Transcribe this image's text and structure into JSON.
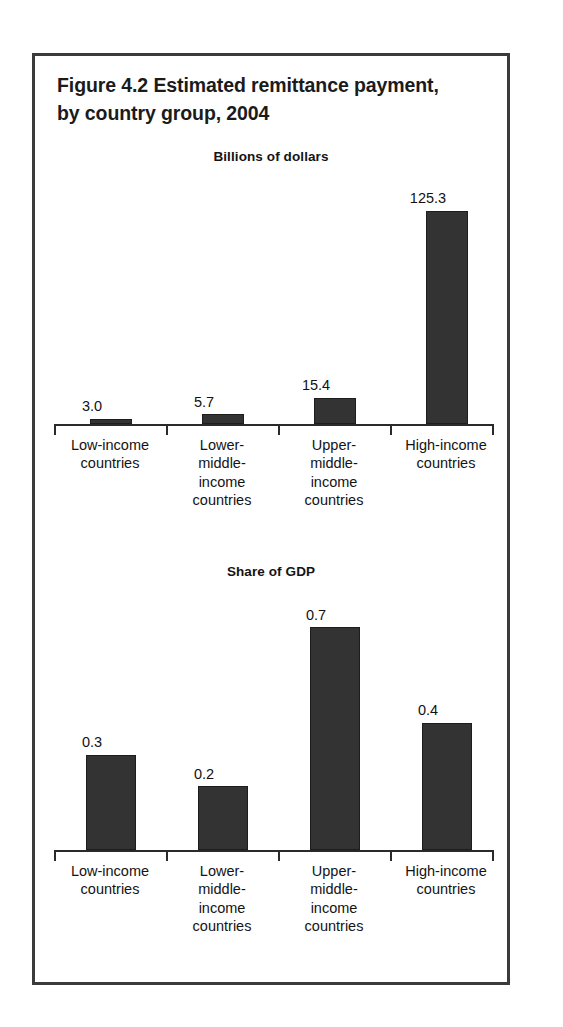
{
  "figure": {
    "title": "Figure 4.2  Estimated remittance payment,\nby country group, 2004"
  },
  "chart_data": [
    {
      "type": "bar",
      "title": "Billions of dollars",
      "xlabel": "",
      "ylabel": "Billions of dollars",
      "ylim": [
        0,
        135
      ],
      "grid": false,
      "legend": "none",
      "categories": [
        "Low-income\ncountries",
        "Lower-\nmiddle-\nincome\ncountries",
        "Upper-\nmiddle-\nincome\ncountries",
        "High-income\ncountries"
      ],
      "values": [
        3.0,
        5.7,
        15.4,
        125.3
      ],
      "value_labels": [
        "3.0",
        "5.7",
        "15.4",
        "125.3"
      ],
      "bar_color": "#333333"
    },
    {
      "type": "bar",
      "title": "Share of GDP",
      "xlabel": "",
      "ylabel": "Share of GDP",
      "ylim": [
        0,
        0.78
      ],
      "grid": false,
      "legend": "none",
      "categories": [
        "Low-income\ncountries",
        "Lower-\nmiddle-\nincome\ncountries",
        "Upper-\nmiddle-\nincome\ncountries",
        "High-income\ncountries"
      ],
      "values": [
        0.3,
        0.2,
        0.7,
        0.4
      ],
      "value_labels": [
        "0.3",
        "0.2",
        "0.7",
        "0.4"
      ],
      "bar_color": "#333333"
    }
  ]
}
